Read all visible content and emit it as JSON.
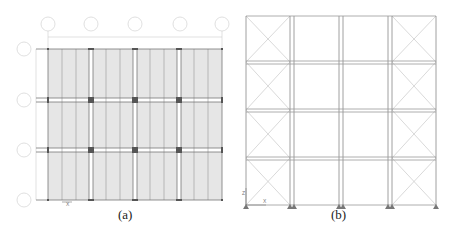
{
  "figure": {
    "panels": [
      {
        "id": "a",
        "caption": "(a)",
        "view": "plan",
        "grid_column_labels": [
          "A",
          "2/C",
          "3/C",
          "3/C",
          "H"
        ],
        "grid_row_labels": [
          "1",
          "1",
          "2",
          "1"
        ],
        "column_dimension_labels": [
          "2.1 m",
          "2.1 m",
          "2.1 m",
          "2.1 m"
        ],
        "row_dimension_labels": [
          "3.0 m",
          "3.0 m",
          "3.0 m"
        ],
        "slab_fill_color": "#e6e6e6",
        "axis_labels": [
          "X"
        ]
      },
      {
        "id": "b",
        "caption": "(b)",
        "view": "elevation",
        "bays": 4,
        "stories": 4,
        "braced_bays": [
          "left",
          "right"
        ],
        "axis_labels": [
          "Z",
          "X"
        ],
        "line_color": "#888888"
      }
    ]
  }
}
